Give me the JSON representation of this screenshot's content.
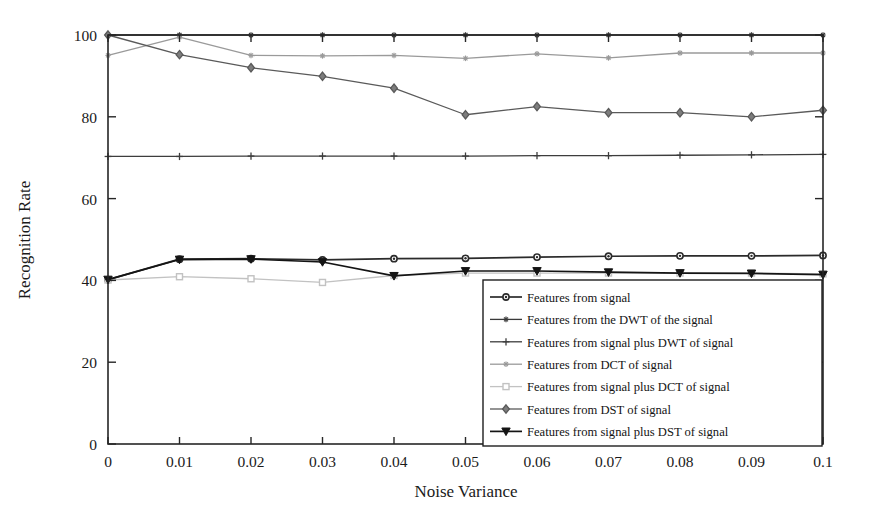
{
  "chart_data": {
    "type": "line",
    "title": "",
    "subtitle": "",
    "xlabel": "Noise Variance",
    "ylabel": "Recognition Rate",
    "x": [
      0,
      0.01,
      0.02,
      0.03,
      0.04,
      0.05,
      0.06,
      0.07,
      0.08,
      0.09,
      0.1
    ],
    "xtick_labels": [
      "0",
      "0.01",
      "0.02",
      "0.03",
      "0.04",
      "0.05",
      "0.06",
      "0.07",
      "0.08",
      "0.09",
      "0.1"
    ],
    "ytick_labels": [
      "0",
      "20",
      "40",
      "60",
      "80",
      "100"
    ],
    "yticks": [
      0,
      20,
      40,
      60,
      80,
      100
    ],
    "xlim": [
      0,
      0.1
    ],
    "ylim": [
      0,
      100
    ],
    "grid": false,
    "legend_position": "lower-right-inside",
    "series": [
      {
        "name": "Features from signal",
        "marker": "circle",
        "color": "#2b2b2b",
        "values": [
          40.2,
          45.2,
          45.3,
          45.0,
          45.3,
          45.4,
          45.7,
          45.9,
          46.0,
          46.0,
          46.1
        ]
      },
      {
        "name": "Features from the DWT of the signal",
        "marker": "star",
        "color": "#3a3a3a",
        "values": [
          100,
          100,
          100,
          100,
          100,
          100,
          100,
          100,
          100,
          100,
          100
        ]
      },
      {
        "name": "Features from signal plus DWT of signal",
        "marker": "plus",
        "color": "#3d3d3d",
        "values": [
          70.3,
          70.3,
          70.4,
          70.4,
          70.4,
          70.4,
          70.5,
          70.5,
          70.6,
          70.7,
          70.8
        ]
      },
      {
        "name": "Features from DCT of signal",
        "marker": "star",
        "color": "#9a9a9a",
        "values": [
          95.0,
          99.5,
          95.0,
          94.9,
          95.0,
          94.3,
          95.4,
          94.4,
          95.6,
          95.6,
          95.6
        ]
      },
      {
        "name": "Features from signal plus DCT of signal",
        "marker": "square",
        "color": "#c2c2c2",
        "values": [
          40.1,
          40.9,
          40.4,
          39.5,
          41.2,
          41.8,
          41.8,
          41.8,
          41.8,
          41.8,
          41.6
        ]
      },
      {
        "name": "Features from DST of signal",
        "marker": "diamond",
        "color": "#5a5a5a",
        "values": [
          100,
          95.2,
          92.0,
          89.9,
          87.0,
          80.5,
          82.5,
          81.0,
          81.0,
          80.0,
          81.6
        ]
      },
      {
        "name": "Features from signal plus DST of signal",
        "marker": "triangle-down",
        "color": "#141414",
        "values": [
          40.2,
          45.1,
          45.2,
          44.5,
          41.1,
          42.3,
          42.3,
          42.0,
          41.8,
          41.7,
          41.4
        ]
      }
    ]
  }
}
